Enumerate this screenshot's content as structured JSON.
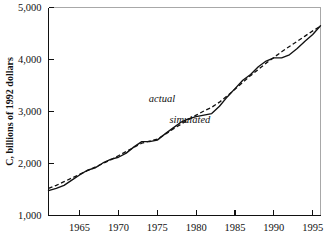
{
  "chart_data": {
    "type": "line",
    "title": "",
    "xlabel": "",
    "ylabel": "C, billions of 1992 dollars",
    "xlim": [
      1961,
      1996
    ],
    "ylim": [
      1000,
      5000
    ],
    "grid": false,
    "legend_position": "inline-annotations",
    "xticks": [
      1965,
      1970,
      1975,
      1980,
      1985,
      1990,
      1995
    ],
    "xtick_labels": [
      "1965",
      "1970",
      "1975",
      "1980",
      "1985",
      "1990",
      "1995"
    ],
    "yticks": [
      1000,
      2000,
      3000,
      4000,
      5000
    ],
    "ytick_labels": [
      "1,000",
      "2,000",
      "3,000",
      "4,000",
      "5,000"
    ],
    "series": [
      {
        "name": "actual",
        "style": "solid",
        "color": "#111111",
        "annotation": "actual",
        "annotation_x": 1975.6,
        "annotation_y": 3180,
        "x": [
          1961,
          1962,
          1963,
          1964,
          1965,
          1966,
          1967,
          1968,
          1969,
          1970,
          1971,
          1972,
          1973,
          1974,
          1975,
          1976,
          1977,
          1978,
          1979,
          1980,
          1981,
          1982,
          1983,
          1984,
          1985,
          1986,
          1987,
          1988,
          1989,
          1990,
          1991,
          1992,
          1993,
          1994,
          1995,
          1996
        ],
        "y": [
          1480,
          1520,
          1580,
          1680,
          1780,
          1870,
          1915,
          2010,
          2080,
          2120,
          2200,
          2320,
          2420,
          2420,
          2450,
          2570,
          2680,
          2790,
          2860,
          2900,
          2930,
          2960,
          3100,
          3280,
          3440,
          3600,
          3710,
          3860,
          3970,
          4030,
          4030,
          4090,
          4210,
          4350,
          4480,
          4650
        ]
      },
      {
        "name": "simulated",
        "style": "dashed",
        "color": "#111111",
        "annotation": "simulated",
        "annotation_x": 1979.2,
        "annotation_y": 2780,
        "x": [
          1961,
          1962,
          1963,
          1964,
          1965,
          1966,
          1967,
          1968,
          1969,
          1970,
          1971,
          1972,
          1973,
          1974,
          1975,
          1976,
          1977,
          1978,
          1979,
          1980,
          1981,
          1982,
          1983,
          1984,
          1985,
          1986,
          1987,
          1988,
          1989,
          1990,
          1991,
          1992,
          1993,
          1994,
          1995,
          1996
        ],
        "y": [
          1520,
          1580,
          1650,
          1720,
          1790,
          1860,
          1930,
          2000,
          2070,
          2150,
          2230,
          2310,
          2390,
          2430,
          2470,
          2560,
          2660,
          2750,
          2840,
          2930,
          3010,
          3080,
          3180,
          3300,
          3430,
          3560,
          3690,
          3810,
          3930,
          4040,
          4150,
          4250,
          4350,
          4450,
          4550,
          4640
        ]
      }
    ]
  },
  "axis": {
    "y_title": "C, billions of 1992 dollars"
  }
}
